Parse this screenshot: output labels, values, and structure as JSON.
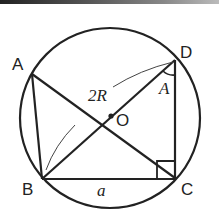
{
  "diagram": {
    "points": {
      "A": "A",
      "B": "B",
      "C": "C",
      "D": "D",
      "O": "O"
    },
    "labels": {
      "diameter": "2R",
      "side": "a",
      "angle": "A"
    },
    "colors": {
      "stroke": "#222222",
      "background": "#ffffff"
    }
  }
}
